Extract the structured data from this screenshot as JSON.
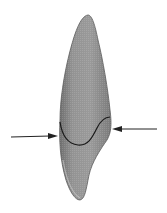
{
  "diagram": {
    "colors": {
      "background": "#ffffff",
      "tooth_fill": "#8e8e8e",
      "tooth_edge": "#5a5a5a",
      "junction_line": "#1a1a1a",
      "arrow": "#222222"
    },
    "elements": [
      {
        "id": "tooth-outline",
        "type": "shape"
      },
      {
        "id": "junction-curve",
        "type": "line"
      },
      {
        "id": "left-arrow",
        "type": "arrow",
        "direction": "right"
      },
      {
        "id": "right-arrow",
        "type": "arrow",
        "direction": "left"
      }
    ]
  }
}
